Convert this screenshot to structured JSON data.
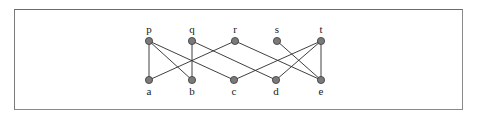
{
  "diagram": {
    "type": "bipartite-graph",
    "top_nodes": [
      {
        "id": "p",
        "label": "p",
        "x": 149,
        "y": 41
      },
      {
        "id": "q",
        "label": "q",
        "x": 192,
        "y": 41
      },
      {
        "id": "r",
        "label": "r",
        "x": 235,
        "y": 41
      },
      {
        "id": "s",
        "label": "s",
        "x": 277,
        "y": 41
      },
      {
        "id": "t",
        "label": "t",
        "x": 321,
        "y": 41
      }
    ],
    "bottom_nodes": [
      {
        "id": "a",
        "label": "a",
        "x": 149,
        "y": 80
      },
      {
        "id": "b",
        "label": "b",
        "x": 192,
        "y": 80
      },
      {
        "id": "c",
        "label": "c",
        "x": 234,
        "y": 80
      },
      {
        "id": "d",
        "label": "d",
        "x": 276,
        "y": 80
      },
      {
        "id": "e",
        "label": "e",
        "x": 321,
        "y": 80
      }
    ],
    "edges": [
      [
        "p",
        "a"
      ],
      [
        "p",
        "b"
      ],
      [
        "p",
        "c"
      ],
      [
        "q",
        "b"
      ],
      [
        "q",
        "d"
      ],
      [
        "r",
        "a"
      ],
      [
        "r",
        "e"
      ],
      [
        "s",
        "e"
      ],
      [
        "t",
        "c"
      ],
      [
        "t",
        "d"
      ],
      [
        "t",
        "e"
      ]
    ],
    "colors": {
      "node_fill": "#7a7a7a",
      "node_stroke": "#3a3a3a",
      "edge": "#2a2a2a",
      "border": "#8a8a8a"
    }
  }
}
